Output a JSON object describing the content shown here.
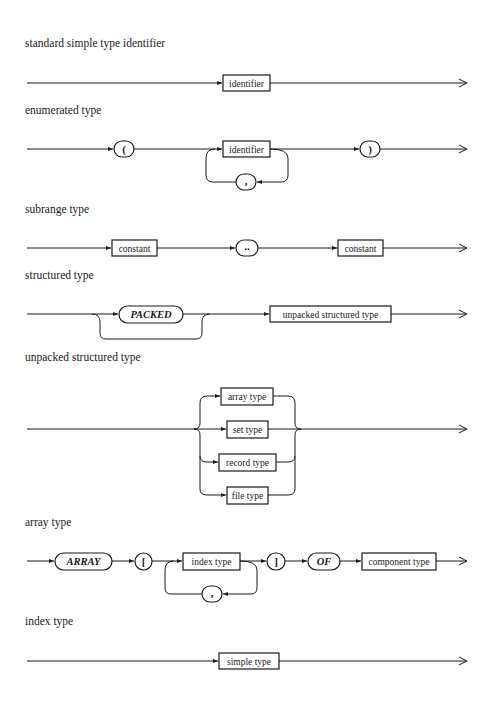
{
  "diagrams": [
    {
      "title": "standard simple type identifier",
      "nodes": [
        {
          "kind": "nonterminal",
          "label": "identifier"
        }
      ]
    },
    {
      "title": "enumerated type",
      "nodes": [
        {
          "kind": "terminal",
          "label": "("
        },
        {
          "kind": "nonterminal",
          "label": "identifier"
        },
        {
          "kind": "terminal",
          "label": ",",
          "role": "loop-separator"
        },
        {
          "kind": "terminal",
          "label": ")"
        }
      ]
    },
    {
      "title": "subrange type",
      "nodes": [
        {
          "kind": "nonterminal",
          "label": "constant"
        },
        {
          "kind": "terminal",
          "label": ".."
        },
        {
          "kind": "nonterminal",
          "label": "constant"
        }
      ]
    },
    {
      "title": "structured type",
      "nodes": [
        {
          "kind": "keyword",
          "label": "PACKED",
          "role": "optional"
        },
        {
          "kind": "nonterminal",
          "label": "unpacked structured type"
        }
      ]
    },
    {
      "title": "unpacked structured type",
      "nodes": [
        {
          "kind": "nonterminal",
          "label": "array type"
        },
        {
          "kind": "nonterminal",
          "label": "set type"
        },
        {
          "kind": "nonterminal",
          "label": "record type"
        },
        {
          "kind": "nonterminal",
          "label": "file type"
        }
      ]
    },
    {
      "title": "array type",
      "nodes": [
        {
          "kind": "keyword",
          "label": "ARRAY"
        },
        {
          "kind": "terminal",
          "label": "["
        },
        {
          "kind": "nonterminal",
          "label": "index type"
        },
        {
          "kind": "terminal",
          "label": ",",
          "role": "loop-separator"
        },
        {
          "kind": "terminal",
          "label": "]"
        },
        {
          "kind": "keyword",
          "label": "OF"
        },
        {
          "kind": "nonterminal",
          "label": "component type"
        }
      ]
    },
    {
      "title": "index type",
      "nodes": [
        {
          "kind": "nonterminal",
          "label": "simple type"
        }
      ]
    }
  ],
  "colors": {
    "ink": "#1a1a1a",
    "paper": "#ffffff"
  }
}
